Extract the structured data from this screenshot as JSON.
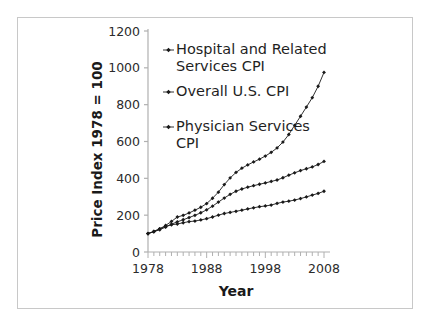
{
  "figure": {
    "border_color": "#c8c8c8",
    "background": "#ffffff",
    "ink_color": "#1a1a1a"
  },
  "chart_data": {
    "type": "line",
    "title": "",
    "xlabel": "Year",
    "ylabel": "Price Index 1978 = 100",
    "xlim": [
      1978,
      2008
    ],
    "ylim": [
      0,
      1200
    ],
    "ytick_labels": [
      "0",
      "200",
      "400",
      "600",
      "800",
      "1000",
      "1200"
    ],
    "yticks": [
      0,
      200,
      400,
      600,
      800,
      1000,
      1200
    ],
    "xtick_labels": [
      "1978",
      "1988",
      "1998",
      "2008"
    ],
    "xticks": [
      1978,
      1988,
      1998,
      2008
    ],
    "minor_xtick_interval": 1,
    "grid": false,
    "legend_position": "upper-left-inside",
    "marker": "diamond",
    "x": [
      1978,
      1979,
      1980,
      1981,
      1982,
      1983,
      1984,
      1985,
      1986,
      1987,
      1988,
      1989,
      1990,
      1991,
      1992,
      1993,
      1994,
      1995,
      1996,
      1997,
      1998,
      1999,
      2000,
      2001,
      2002,
      2003,
      2004,
      2005,
      2006,
      2007,
      2008
    ],
    "series": [
      {
        "name": "Hospital and Related Services CPI",
        "values": [
          100,
          112,
          126,
          144,
          166,
          190,
          199,
          212,
          227,
          243,
          263,
          292,
          325,
          366,
          402,
          432,
          455,
          473,
          489,
          504,
          521,
          541,
          565,
          597,
          638,
          688,
          737,
          787,
          838,
          900,
          975
        ]
      },
      {
        "name": "Overall U.S. CPI",
        "values": [
          100,
          111,
          126,
          139,
          148,
          152,
          159,
          165,
          168,
          174,
          181,
          190,
          200,
          209,
          215,
          221,
          227,
          234,
          240,
          246,
          250,
          255,
          264,
          271,
          276,
          282,
          290,
          299,
          309,
          318,
          330
        ]
      },
      {
        "name": "Physician Services CPI",
        "values": [
          100,
          110,
          121,
          135,
          151,
          164,
          175,
          187,
          199,
          213,
          229,
          249,
          271,
          293,
          313,
          330,
          342,
          352,
          360,
          368,
          375,
          383,
          391,
          403,
          417,
          430,
          442,
          452,
          462,
          475,
          492
        ]
      }
    ],
    "series_order_top_to_bottom": [
      "Hospital and Related Services CPI",
      "Physician Services CPI",
      "Overall U.S. CPI"
    ],
    "endpoint_values_2008": {
      "Hospital and Related Services CPI": 975,
      "Physician Services CPI": 492,
      "Overall U.S. CPI": 330
    }
  },
  "legend": {
    "entries": [
      {
        "line1": "Hospital and Related",
        "line2": "Services CPI"
      },
      {
        "line1": "Overall U.S. CPI",
        "line2": ""
      },
      {
        "line1": "Physician Services",
        "line2": "CPI"
      }
    ]
  }
}
